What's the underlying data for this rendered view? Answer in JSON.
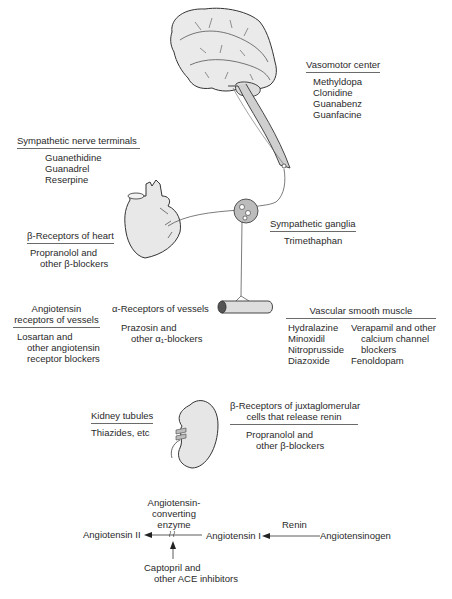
{
  "figure": {
    "illustrations": [
      "brain-spinal-cord",
      "heart",
      "sympathetic-ganglion",
      "blood-vessel",
      "kidney"
    ],
    "colors": {
      "organ_fill": "#e6e6e6",
      "organ_stroke": "#333333",
      "ganglion_fill": "#b8b8b8",
      "text": "#2a2a2a",
      "rule": "#6a6a6a"
    }
  },
  "vasomotor_center": {
    "title": "Vasomotor center",
    "drugs": [
      "Methyldopa",
      "Clonidine",
      "Guanabenz",
      "Guanfacine"
    ]
  },
  "sympathetic_nerve_terminals": {
    "title": "Sympathetic nerve terminals",
    "drugs": [
      "Guanethidine",
      "Guanadrel",
      "Reserpine"
    ]
  },
  "beta_receptors_heart": {
    "title": "β-Receptors of heart",
    "drugs": [
      "Propranolol and",
      "other β-blockers"
    ]
  },
  "sympathetic_ganglia": {
    "title": "Sympathetic ganglia",
    "drugs": [
      "Trimethaphan"
    ]
  },
  "angiotensin_receptors": {
    "title_lines": [
      "Angiotensin",
      "receptors of vessels"
    ],
    "drugs": [
      "Losartan and",
      "other angiotensin",
      "receptor blockers"
    ]
  },
  "alpha_receptors": {
    "title": "α-Receptors of vessels",
    "drugs": [
      "Prazosin and",
      "other α₁-blockers"
    ]
  },
  "vascular_smooth_muscle": {
    "title": "Vascular smooth muscle",
    "col1": [
      "Hydralazine",
      "Minoxidil",
      "Nitroprusside",
      "Diazoxide"
    ],
    "col2": [
      "Verapamil and other",
      "calcium channel",
      "blockers",
      "Fenoldopam"
    ]
  },
  "kidney_tubules": {
    "title": "Kidney tubules",
    "drugs": [
      "Thiazides, etc"
    ]
  },
  "beta_receptors_juxtaglomerular": {
    "title_lines": [
      "β-Receptors of juxtaglomerular",
      "cells that release renin"
    ],
    "drugs": [
      "Propranolol and",
      "other β-blockers"
    ]
  },
  "raas_pathway": {
    "ace_label": [
      "Angiotensin-",
      "converting",
      "enzyme"
    ],
    "angiotensin_ii": "Angiotensin II",
    "angiotensin_i": "Angiotensin I",
    "renin": "Renin",
    "angiotensinogen": "Angiotensinogen",
    "ace_inhibitors": [
      "Captopril and",
      "other ACE inhibitors"
    ]
  }
}
